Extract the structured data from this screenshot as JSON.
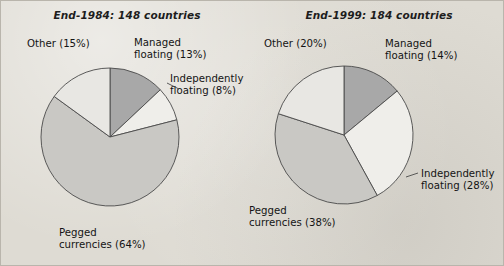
{
  "figure": {
    "background_color": "#dedbd3",
    "border_color": "#b9b5ac",
    "title": ""
  },
  "palette": {
    "managed_floating": "#a8a8a8",
    "independently_floating": "#efeeea",
    "pegged_currencies": "#c9c8c4",
    "other": "#e8e7e3",
    "outline": "#4a4a4a",
    "text": "#141414"
  },
  "charts": [
    {
      "id": "end-1984",
      "title": "End-1984: 148 countries",
      "labels": {
        "other": "Other (15%)",
        "managed": "Managed\nfloating (13%)",
        "managed_l1": "Managed",
        "managed_l2": "floating (13%)",
        "indep_l1": "Independently",
        "indep_l2": "floating (8%)",
        "pegged_l1": "Pegged",
        "pegged_l2": "currencies (64%)"
      }
    },
    {
      "id": "end-1999",
      "title": "End-1999: 184 countries",
      "labels": {
        "other": "Other (20%)",
        "managed_l1": "Managed",
        "managed_l2": "floating (14%)",
        "indep_l1": "Independently",
        "indep_l2": "floating (28%)",
        "pegged_l1": "Pegged",
        "pegged_l2": "currencies (38%)"
      }
    }
  ],
  "chart_data": [
    {
      "type": "pie",
      "title": "End-1984: 148 countries",
      "subtitle": "",
      "total_countries": 148,
      "start_angle_deg": 0,
      "direction": "clockwise",
      "legend": "labels on slices",
      "categories": [
        "Managed floating",
        "Independently floating",
        "Pegged currencies",
        "Other"
      ],
      "values": [
        13,
        8,
        64,
        15
      ],
      "unit": "%",
      "colors": [
        "#a8a8a8",
        "#efeeea",
        "#c9c8c4",
        "#e8e7e3"
      ],
      "data_labels": [
        "Managed floating (13%)",
        "Independently floating (8%)",
        "Pegged currencies (64%)",
        "Other (15%)"
      ],
      "xlabel": "",
      "ylabel": ""
    },
    {
      "type": "pie",
      "title": "End-1999: 184 countries",
      "subtitle": "",
      "total_countries": 184,
      "start_angle_deg": 0,
      "direction": "clockwise",
      "legend": "labels on slices",
      "categories": [
        "Managed floating",
        "Independently floating",
        "Pegged currencies",
        "Other"
      ],
      "values": [
        14,
        28,
        38,
        20
      ],
      "unit": "%",
      "colors": [
        "#a8a8a8",
        "#efeeea",
        "#c9c8c4",
        "#e8e7e3"
      ],
      "data_labels": [
        "Managed floating (14%)",
        "Independently floating (28%)",
        "Pegged currencies (38%)",
        "Other (20%)"
      ],
      "xlabel": "",
      "ylabel": ""
    }
  ]
}
